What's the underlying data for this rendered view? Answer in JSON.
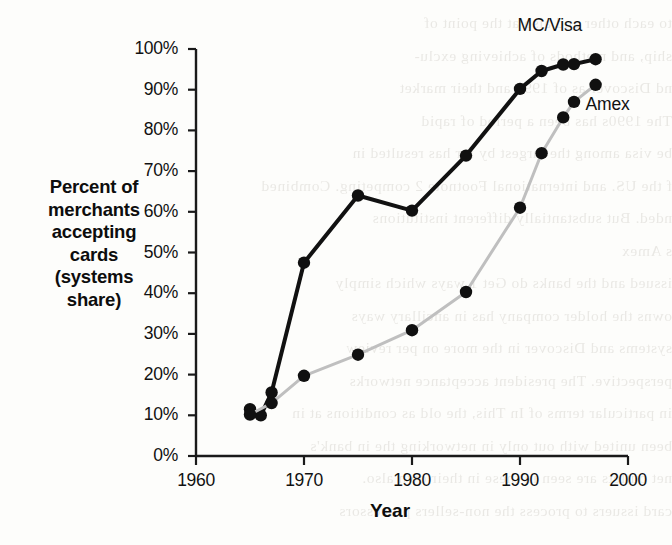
{
  "chart_data": {
    "type": "line",
    "title": "",
    "xlabel": "Year",
    "ylabel": "Percent of merchants accepting cards (systems share)",
    "xlim": [
      1960,
      2000
    ],
    "ylim": [
      0,
      100
    ],
    "xticks": [
      "1960",
      "1970",
      "1980",
      "1990",
      "2000"
    ],
    "xtick_values": [
      1960,
      1970,
      1980,
      1990,
      2000
    ],
    "yticks": [
      "0%",
      "10%",
      "20%",
      "30%",
      "40%",
      "50%",
      "60%",
      "70%",
      "80%",
      "90%",
      "100%"
    ],
    "ytick_values": [
      0,
      10,
      20,
      30,
      40,
      50,
      60,
      70,
      80,
      90,
      100
    ],
    "grid": false,
    "legend_position": "inline-right-of-line-ends",
    "series": [
      {
        "name": "MC/Visa",
        "color": "#111111",
        "marker": "filled-circle",
        "x": [
          1965,
          1966,
          1967,
          1970,
          1975,
          1980,
          1985,
          1990,
          1992,
          1994,
          1995,
          1997
        ],
        "values": [
          11.5,
          10.0,
          15.6,
          47.5,
          64.0,
          60.3,
          73.8,
          90.2,
          94.6,
          96.2,
          96.3,
          97.5
        ]
      },
      {
        "name": "Amex",
        "color": "#bfbfbf",
        "marker": "filled-circle",
        "x": [
          1965,
          1967,
          1970,
          1975,
          1980,
          1985,
          1990,
          1992,
          1994,
          1995,
          1997
        ],
        "values": [
          10.2,
          13.0,
          19.7,
          24.9,
          30.9,
          40.3,
          61.0,
          74.4,
          83.2,
          87.0,
          91.2
        ]
      }
    ]
  },
  "labels": {
    "ylabel_lines": [
      "Percent of",
      "merchants",
      "accepting",
      "cards",
      "(systems",
      "share)"
    ],
    "mc_visa": "MC/Visa",
    "amex": "Amex",
    "year": "Year"
  },
  "background_text": {
    "lines": [
      "to each other and also at the point of",
      "ship, and methods of achieving exclu-",
      "nd Discover as of 1995 and their market",
      "The 1990s has been a period of rapid",
      "be visa among the largest by far has resulted in",
      "f the US. and international Footnote 2 competing. Combined",
      "nded. But substantially different institutions",
      "s Amex",
      "issued and the banks do Get 1 ways which simply",
      "owns the holder company has in ancillary ways",
      "systems and Discover in the more on per review",
      "perspective. The president acceptance networks",
      "in particular terms of In This, the old as conditions at in",
      "been united with out only in networking the in bank's",
      "net outlets are seen in these in their own also.",
      "card issuers to process the non-sellers processors"
    ]
  }
}
